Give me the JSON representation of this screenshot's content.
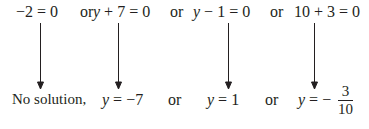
{
  "top_row": {
    "eq1": "−2 = 0",
    "or1": "or",
    "eq2_var": "y",
    "eq2_rest": " + 7 = 0",
    "or2": "or",
    "eq3_var": "y",
    "eq3_rest": " − 1 = 0",
    "or3": "or",
    "eq4": "10 + 3 = 0"
  },
  "bottom_row": {
    "sol1": "No solution,",
    "sol2_var": "y",
    "sol2_rest": " = −7",
    "or1": "or",
    "sol3_var": "y",
    "sol3_rest": " = 1",
    "or2": "or",
    "sol4_var": "y",
    "sol4_rest": " = −",
    "sol4_num": "3",
    "sol4_den": "10"
  },
  "arrows": [
    {
      "from": "−2 = 0",
      "to": "No solution,"
    },
    {
      "from": "y + 7 = 0",
      "to": "y = −7"
    },
    {
      "from": "y − 1 = 0",
      "to": "y = 1"
    },
    {
      "from": "10 + 3 = 0",
      "to": "y = −3/10"
    }
  ],
  "colors": {
    "ink": "#231f20",
    "background": "#ffffff"
  }
}
